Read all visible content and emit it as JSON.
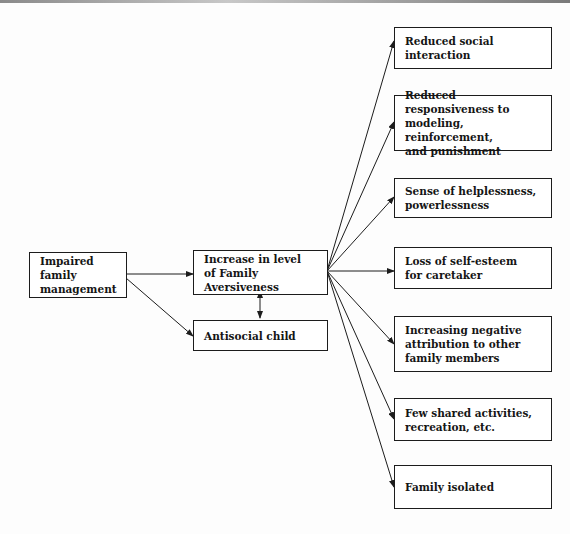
{
  "diagram": {
    "source": {
      "label": "Impaired family\nmanagement"
    },
    "center": {
      "label": "Increase in level\nof Family Aversiveness"
    },
    "child": {
      "label": "Antisocial child"
    },
    "outcomes": [
      {
        "label": "Reduced social\ninteraction"
      },
      {
        "label": "Reduced responsiveness to\nmodeling, reinforcement,\nand punishment"
      },
      {
        "label": "Sense of helplessness,\npowerlessness"
      },
      {
        "label": "Loss of self-esteem\nfor caretaker"
      },
      {
        "label": "Increasing negative\nattribution to other\nfamily members"
      },
      {
        "label": "Few shared activities,\nrecreation, etc."
      },
      {
        "label": "Family isolated"
      }
    ]
  }
}
